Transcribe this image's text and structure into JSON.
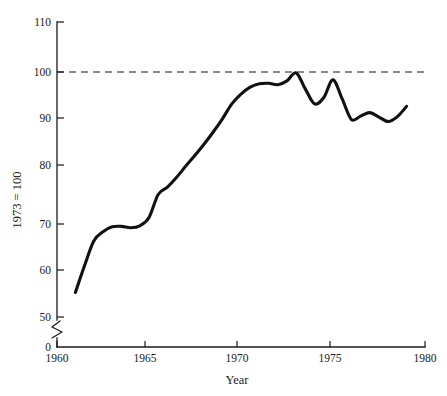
{
  "chart_data": {
    "type": "line",
    "title": "",
    "xlabel": "Year",
    "ylabel": "1973 = 100",
    "xlim": [
      1960,
      1980
    ],
    "ylim": [
      0,
      110
    ],
    "y_axis_break": {
      "from": 0,
      "to": 50,
      "present": true
    },
    "grid": false,
    "legend": null,
    "xticks": [
      1960,
      1965,
      1970,
      1975,
      1980
    ],
    "xtick_labels": [
      "1960",
      "1965",
      "1970",
      "1975",
      "1980"
    ],
    "yticks": [
      0,
      50,
      60,
      70,
      80,
      90,
      100,
      110
    ],
    "ytick_labels": [
      "0",
      "50",
      "60",
      "70",
      "80",
      "90",
      "100",
      "110"
    ],
    "reference_lines": [
      {
        "name": "index-base-100",
        "y": 100,
        "style": "dashed",
        "label": ""
      }
    ],
    "series": [
      {
        "name": "index",
        "x": [
          1961,
          1961.5,
          1962,
          1962.5,
          1963,
          1963.5,
          1964,
          1964.5,
          1965,
          1965.5,
          1966,
          1966.5,
          1967,
          1967.5,
          1968,
          1968.5,
          1969,
          1969.5,
          1970,
          1970.5,
          1971,
          1971.5,
          1972,
          1972.5,
          1973,
          1973.5,
          1974,
          1974.5,
          1975,
          1975.5,
          1976,
          1976.5,
          1977,
          1977.5,
          1978,
          1978.5,
          1979
        ],
        "values": [
          55.0,
          60.5,
          65.5,
          67.4,
          68.4,
          68.5,
          68.2,
          68.6,
          70.3,
          75.0,
          76.5,
          78.5,
          80.8,
          83.0,
          85.3,
          87.8,
          90.5,
          93.5,
          95.5,
          96.9,
          97.6,
          97.7,
          97.4,
          98.2,
          99.8,
          96.5,
          93.5,
          94.8,
          98.4,
          94.5,
          90.3,
          91.0,
          91.7,
          90.8,
          89.9,
          90.9,
          93.0
        ]
      }
    ]
  },
  "axes": {
    "x_title": "Year",
    "y_title": "1973 = 100"
  }
}
